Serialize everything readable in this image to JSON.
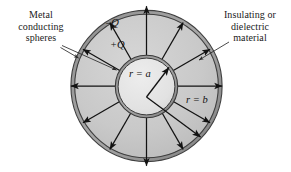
{
  "figure": {
    "background_color": "#ffffff",
    "annotations": {
      "metal_spheres": "Metal\nconducting\nspheres",
      "metal_spheres_lines": [
        "Metal",
        "conducting",
        "spheres"
      ],
      "insulating": "Insulating or\ndielectric\nmaterial",
      "insulating_lines": [
        "Insulating or",
        "dielectric",
        "material"
      ]
    },
    "charge_labels": {
      "outer_charge": "–Q",
      "inner_charge": "+Q"
    },
    "radius_labels": {
      "inner_radius": "r = a",
      "outer_radius": "r = b"
    },
    "geometry": {
      "center_x": 146.5,
      "center_y": 86,
      "outer_radius": 76,
      "inner_radius": 31,
      "shell_thickness": 4,
      "arrow_count": 12
    },
    "colors": {
      "dielectric_fill": "#c9c9c9",
      "inner_sphere_fill": "#e2e2e2",
      "shell_stroke": "#4a4a4a",
      "shell_fill": "#9a9a9a",
      "arrow_color": "#121212",
      "text_color": "#1a1a1a",
      "leader_color": "#2b2b2b"
    }
  }
}
